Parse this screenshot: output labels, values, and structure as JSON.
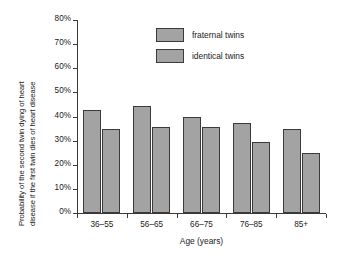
{
  "chart_data": {
    "type": "bar",
    "title": "",
    "subtitle": "",
    "categories": [
      "36–55",
      "56–65",
      "66–75",
      "76–85",
      "85+"
    ],
    "series": [
      {
        "name": "fraternal twins",
        "values": [
          42.5,
          44.5,
          40.0,
          37.5,
          35.0
        ],
        "color": "#a3a3a3"
      },
      {
        "name": "identical twins",
        "values": [
          35.0,
          35.5,
          35.5,
          29.5,
          25.0
        ],
        "color": "#a3a3a3"
      }
    ],
    "xlabel": "Age (years)",
    "ylabel": "Probability of the second twin dying of heart disease if the first twin dies of heart disease",
    "ylabel_line_1": "Probability of the second twin dying of heart",
    "ylabel_line_2": "disease if the first twin dies of heart disease",
    "ylim": [
      0,
      80
    ],
    "ytick_values": [
      0,
      10,
      20,
      30,
      40,
      50,
      60,
      70,
      80
    ],
    "ytick_labels": [
      "0%",
      "10%",
      "20%",
      "30%",
      "40%",
      "50%",
      "60%",
      "70%",
      "80%"
    ],
    "grid": false,
    "legend_position": "upper center",
    "legend_entries": [
      "fraternal twins",
      "identical twins"
    ],
    "value_unit": "%",
    "bar_edge_color": "#3a3a3a",
    "axis_color": "#3a3a3a",
    "background_color": "#ffffff"
  }
}
